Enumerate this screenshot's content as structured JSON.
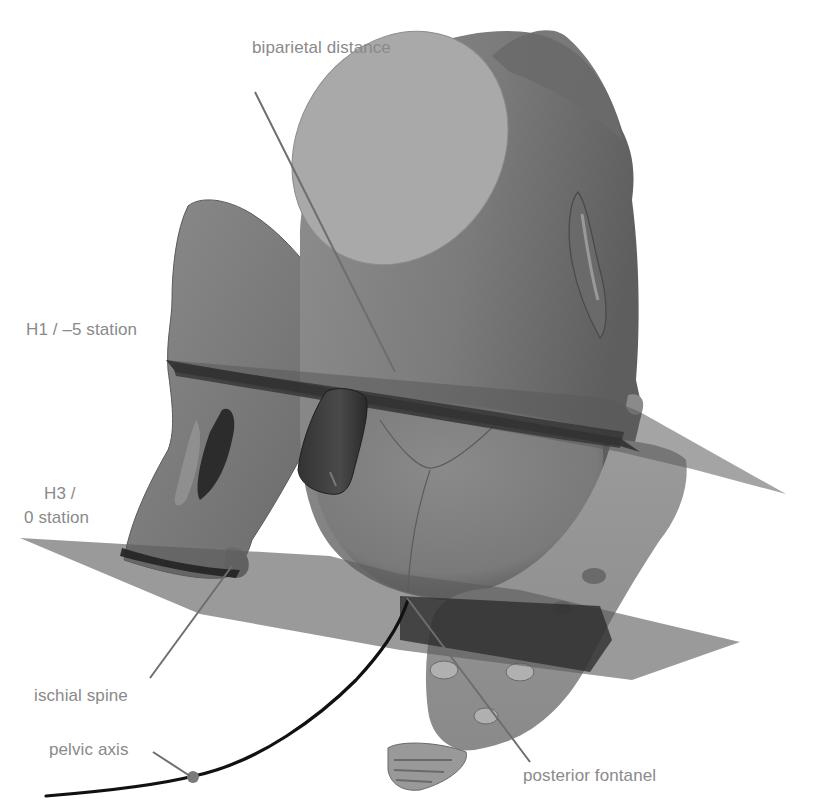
{
  "figure": {
    "colors": {
      "background": "#ffffff",
      "label_text": "#8a8a8a",
      "leader_line": "#6e6e6e",
      "head_surface": "#7c7c7c",
      "head_cut": "#a9a9a9",
      "bone": "#7a7a7a",
      "plane": "#5a5a5a",
      "plane_band": "#3a3a3a",
      "axis_line": "#111111",
      "axis_dot": "#7a7a7a"
    }
  },
  "labels": {
    "biparietal": {
      "text": "biparietal distance",
      "x": 252,
      "y": 38
    },
    "h1": {
      "text": "H1 / –5 station",
      "x": 26,
      "y": 320
    },
    "h3_line1": {
      "text": "H3 /",
      "x": 44,
      "y": 484
    },
    "h3_line2": {
      "text": "0 station",
      "x": 24,
      "y": 508
    },
    "ischial": {
      "text": "ischial spine",
      "x": 34,
      "y": 686
    },
    "pelvic_axis": {
      "text": "pelvic axis",
      "x": 49,
      "y": 740
    },
    "posterior_fontanel": {
      "text": "posterior fontanel",
      "x": 523,
      "y": 766
    }
  },
  "leaders": [
    {
      "name": "biparietal-leader",
      "from": [
        255,
        92
      ],
      "to": [
        395,
        370
      ]
    },
    {
      "name": "ischial-spine-leader",
      "from": [
        150,
        678
      ],
      "to": [
        232,
        565
      ]
    },
    {
      "name": "pelvic-axis-leader",
      "from": [
        153,
        752
      ],
      "to": [
        192,
        778
      ]
    },
    {
      "name": "posterior-fontanel-leader",
      "from": [
        530,
        762
      ],
      "to": [
        405,
        598
      ]
    }
  ],
  "planes": [
    {
      "name": "H1 / -5 station",
      "level": "upper"
    },
    {
      "name": "H3 / 0 station",
      "level": "lower"
    }
  ]
}
